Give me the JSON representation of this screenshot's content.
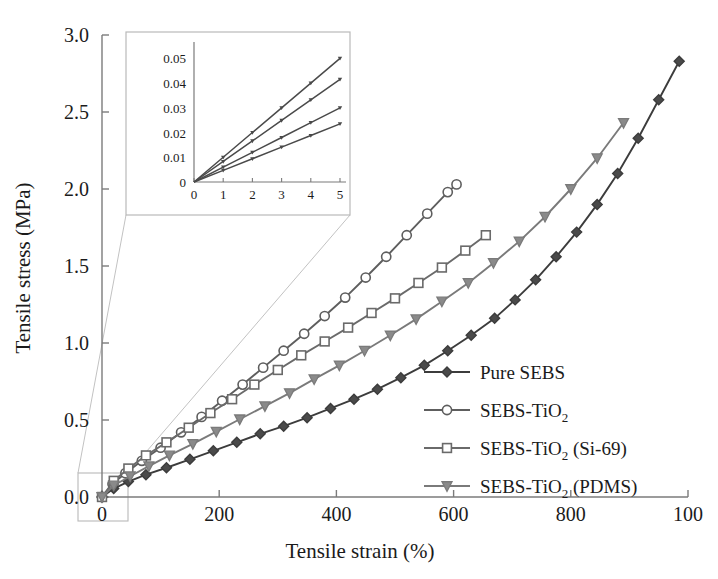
{
  "figure": {
    "background": "#ffffff",
    "line_color_dark": "#3c3c3c",
    "line_color_mid": "#5e5e5e",
    "line_color_light": "#7a7a7a",
    "axis_color": "#7b7b7b",
    "inset_border_color": "#b9b9b9",
    "connector_color": "#c2c2c2"
  },
  "chart_data": {
    "type": "line",
    "title": "",
    "xlabel": "Tensile strain (%)",
    "ylabel": "Tensile stress (MPa)",
    "xlim": [
      0,
      1000
    ],
    "ylim": [
      0,
      3.0
    ],
    "xticks": [
      0,
      200,
      400,
      600,
      800,
      1000
    ],
    "xtick_labels": [
      "0",
      "200",
      "400",
      "600",
      "800",
      "100"
    ],
    "yticks": [
      0.0,
      0.5,
      1.0,
      1.5,
      2.0,
      2.5,
      3.0
    ],
    "ytick_labels": [
      "0.0",
      "0.5",
      "1.0",
      "1.5",
      "2.0",
      "2.5",
      "3.0"
    ],
    "grid": false,
    "legend_position": "lower-right",
    "series": [
      {
        "name": "Pure SEBS",
        "label_main": "Pure SEBS",
        "label_sub": "",
        "label_tail": "",
        "marker": "diamond-filled",
        "color": "#3c3c3c",
        "x": [
          0,
          20,
          45,
          75,
          110,
          150,
          190,
          230,
          270,
          310,
          350,
          390,
          430,
          470,
          510,
          550,
          590,
          630,
          670,
          705,
          740,
          775,
          810,
          845,
          880,
          915,
          950,
          985
        ],
        "y": [
          0.0,
          0.055,
          0.1,
          0.145,
          0.19,
          0.245,
          0.3,
          0.355,
          0.41,
          0.46,
          0.515,
          0.575,
          0.635,
          0.7,
          0.775,
          0.855,
          0.95,
          1.05,
          1.16,
          1.28,
          1.41,
          1.56,
          1.72,
          1.9,
          2.1,
          2.33,
          2.58,
          2.83
        ]
      },
      {
        "name": "SEBS-TiO2",
        "label_main": "SEBS-TiO",
        "label_sub": "2",
        "label_tail": "",
        "marker": "circle-open",
        "color": "#5e5e5e",
        "x": [
          0,
          18,
          40,
          68,
          100,
          135,
          170,
          205,
          240,
          275,
          310,
          345,
          380,
          415,
          450,
          485,
          520,
          555,
          590,
          605
        ],
        "y": [
          0.0,
          0.085,
          0.155,
          0.235,
          0.32,
          0.42,
          0.52,
          0.625,
          0.73,
          0.84,
          0.95,
          1.06,
          1.175,
          1.295,
          1.425,
          1.56,
          1.7,
          1.84,
          1.98,
          2.03
        ]
      },
      {
        "name": "SEBS-TiO2 (Si-69)",
        "label_main": "SEBS-TiO",
        "label_sub": "2",
        "label_tail": " (Si-69)",
        "marker": "square-open",
        "color": "#6a6a6a",
        "x": [
          0,
          20,
          45,
          75,
          110,
          148,
          185,
          222,
          260,
          300,
          340,
          380,
          420,
          460,
          500,
          540,
          580,
          620,
          655
        ],
        "y": [
          0.0,
          0.105,
          0.185,
          0.27,
          0.355,
          0.45,
          0.545,
          0.635,
          0.73,
          0.825,
          0.92,
          1.01,
          1.1,
          1.195,
          1.29,
          1.39,
          1.49,
          1.6,
          1.7
        ]
      },
      {
        "name": "SEBS-TiO2 (PDMS)",
        "label_main": "SEBS-TiO",
        "label_sub": "2",
        "label_tail": " (PDMS)",
        "marker": "triangle-down-filled",
        "color": "#7a7a7a",
        "x": [
          0,
          20,
          48,
          80,
          115,
          155,
          195,
          235,
          278,
          320,
          362,
          405,
          448,
          492,
          536,
          580,
          625,
          668,
          712,
          756,
          800,
          845,
          890
        ],
        "y": [
          0.0,
          0.075,
          0.135,
          0.2,
          0.27,
          0.345,
          0.425,
          0.505,
          0.59,
          0.675,
          0.765,
          0.855,
          0.95,
          1.05,
          1.155,
          1.27,
          1.39,
          1.52,
          1.66,
          1.82,
          2.0,
          2.2,
          2.43
        ]
      }
    ]
  },
  "inset": {
    "xlim": [
      0,
      5
    ],
    "ylim": [
      0,
      0.055
    ],
    "xticks": [
      0,
      1,
      2,
      3,
      4,
      5
    ],
    "xtick_labels": [
      "0",
      "1",
      "2",
      "3",
      "4",
      "5"
    ],
    "yticks": [
      0,
      0.01,
      0.02,
      0.03,
      0.04,
      0.05
    ],
    "ytick_labels": [
      "0",
      "0.01",
      "0.02",
      "0.03",
      "0.04",
      "0.05"
    ],
    "series": [
      {
        "name": "SEBS-TiO2 (Si-69)",
        "slope_end_y": 0.05,
        "x": [
          0,
          1,
          2,
          3,
          4,
          5
        ],
        "y": [
          0,
          0.01,
          0.02,
          0.03,
          0.04,
          0.05
        ]
      },
      {
        "name": "SEBS-TiO2",
        "slope_end_y": 0.0415,
        "x": [
          0,
          1,
          2,
          3,
          4,
          5
        ],
        "y": [
          0,
          0.0083,
          0.0166,
          0.0249,
          0.0332,
          0.0415
        ]
      },
      {
        "name": "SEBS-TiO2 (PDMS)",
        "slope_end_y": 0.03,
        "x": [
          0,
          1,
          2,
          3,
          4,
          5
        ],
        "y": [
          0,
          0.006,
          0.012,
          0.018,
          0.024,
          0.03
        ]
      },
      {
        "name": "Pure SEBS",
        "slope_end_y": 0.0235,
        "x": [
          0,
          1,
          2,
          3,
          4,
          5
        ],
        "y": [
          0,
          0.0047,
          0.0094,
          0.0141,
          0.0188,
          0.0235
        ]
      }
    ]
  }
}
